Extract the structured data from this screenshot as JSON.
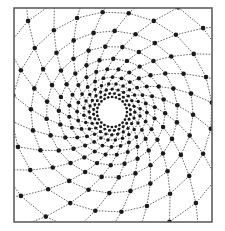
{
  "diagram": {
    "type": "spiral-mesh",
    "frame": {
      "x": 14,
      "y": 8,
      "width": 198,
      "height": 214,
      "stroke": "#555555"
    },
    "hole": {
      "cx": 112,
      "cy": 112,
      "r": 12
    },
    "mesh": {
      "spokes": 24,
      "rings": 14,
      "inner_radius": 15,
      "growth": 1.235,
      "twist_per_ring": 0.135,
      "line_color": "#444444",
      "node_color": "#1a1a1a",
      "node_radius_min": 1.3,
      "node_radius_max": 2.3
    }
  }
}
